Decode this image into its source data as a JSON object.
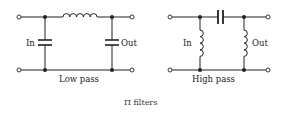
{
  "figure": {
    "caption": "Π filters"
  },
  "low_pass": {
    "title": "Low pass",
    "input_label": "In",
    "output_label": "Out",
    "series_element": "inductor",
    "shunt_elements": [
      "capacitor",
      "capacitor"
    ]
  },
  "high_pass": {
    "title": "High pass",
    "input_label": "In",
    "output_label": "Out",
    "series_element": "capacitor",
    "shunt_elements": [
      "inductor",
      "inductor"
    ]
  },
  "colors": {
    "line": "#222222",
    "background": "#ffffff"
  }
}
